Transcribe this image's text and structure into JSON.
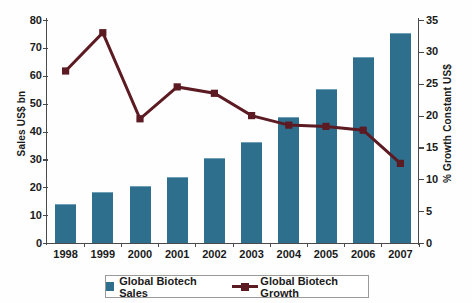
{
  "chart_data": {
    "type": "bar",
    "title": "",
    "subtitle": "",
    "xlabel": "",
    "ylabel": "Sales US$ bn",
    "y2label": "% Growth Constant US$",
    "categories": [
      "1998",
      "1999",
      "2000",
      "2001",
      "2002",
      "2003",
      "2004",
      "2005",
      "2006",
      "2007"
    ],
    "ylim": [
      0,
      80
    ],
    "y2lim": [
      0,
      35
    ],
    "yticks": [
      "0",
      "10",
      "20",
      "30",
      "40",
      "50",
      "60",
      "70",
      "80"
    ],
    "y2ticks": [
      "0",
      "5",
      "10",
      "15",
      "20",
      "25",
      "30",
      "35"
    ],
    "grid": false,
    "legend_position": "bottom",
    "series": [
      {
        "name": "Global Biotech Sales",
        "type": "bar",
        "axis": "left",
        "color": "#2e6f8e",
        "values": [
          13.5,
          18,
          20,
          23.5,
          30,
          36,
          45,
          55,
          66.5,
          75
        ]
      },
      {
        "name": "Global Biotech Growth",
        "type": "line",
        "axis": "right",
        "color": "#5c1a22",
        "marker": "square",
        "values": [
          27,
          33,
          19.5,
          24.5,
          23.5,
          20,
          18.5,
          18.3,
          17.7,
          12.5
        ]
      }
    ]
  },
  "legend": {
    "items": [
      {
        "label": "Global Biotech Sales",
        "marker": "filled-square-swatch"
      },
      {
        "label": "Global Biotech Growth",
        "marker": "line-with-square-marker"
      }
    ]
  },
  "colors": {
    "bar": "#2e6f8e",
    "bar_highlight": "#6ea0b8",
    "line": "#5c1a22",
    "axis": "#4a4a4a",
    "background": "#fefefe"
  }
}
